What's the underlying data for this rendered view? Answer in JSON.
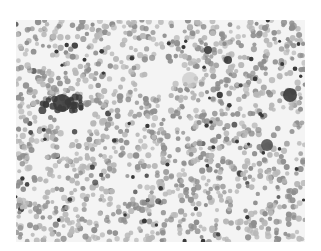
{
  "image": {
    "subject": "microscopy blood smear",
    "description": "Grayscale light micrograph of a peripheral blood smear showing densely scattered red blood cells, with a few darker nucleated cells and clumps, and several clear patches.",
    "colors": {
      "background": "#f4f4f4",
      "cell_light": "#b8b8b8",
      "cell_mid": "#8e8e8e",
      "cell_dark": "#3a3a3a",
      "large_cell": "#555555",
      "pale_cell": "#c8c8c8"
    },
    "features": [
      {
        "type": "dark-cluster",
        "x": 62,
        "y": 103,
        "r": 9
      },
      {
        "type": "pale-round-cell",
        "x": 190,
        "y": 80,
        "r": 8
      },
      {
        "type": "dark-round-cell",
        "x": 267,
        "y": 145,
        "r": 6
      },
      {
        "type": "dark-clump",
        "x": 290,
        "y": 95,
        "r": 7
      },
      {
        "type": "dark-clump",
        "x": 208,
        "y": 50,
        "r": 4
      },
      {
        "type": "dark-clump",
        "x": 228,
        "y": 60,
        "r": 4
      }
    ]
  }
}
